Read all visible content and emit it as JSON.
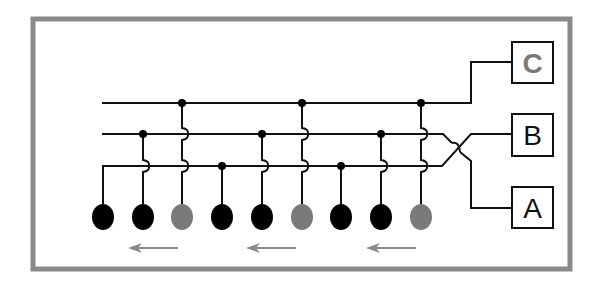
{
  "diagram": {
    "frame": {
      "x": 33,
      "y": 19,
      "w": 537,
      "h": 250,
      "stroke": "#8a8a8a",
      "stroke_width": 5
    },
    "bus_lines": [
      {
        "id": "C",
        "y": 103,
        "x_start": 102
      },
      {
        "id": "B",
        "y": 134,
        "x_start": 102
      },
      {
        "id": "A",
        "y": 166,
        "x_start": 103
      }
    ],
    "columns": [
      {
        "x": 103,
        "phase": "A",
        "color": "#000000"
      },
      {
        "x": 143,
        "phase": "B",
        "color": "#000000"
      },
      {
        "x": 182,
        "phase": "C",
        "color": "#7a7a7a"
      },
      {
        "x": 222,
        "phase": "A",
        "color": "#000000"
      },
      {
        "x": 262,
        "phase": "B",
        "color": "#000000"
      },
      {
        "x": 302,
        "phase": "C",
        "color": "#7a7a7a"
      },
      {
        "x": 341,
        "phase": "A",
        "color": "#000000"
      },
      {
        "x": 381,
        "phase": "B",
        "color": "#000000"
      },
      {
        "x": 421,
        "phase": "C",
        "color": "#7a7a7a"
      }
    ],
    "dot_y": 217,
    "arrows": [
      {
        "x1": 178,
        "x2": 128,
        "y": 248
      },
      {
        "x1": 296,
        "x2": 246,
        "y": 248
      },
      {
        "x1": 416,
        "x2": 366,
        "y": 248
      }
    ],
    "arrow_color": "#8a8a8a",
    "labels": [
      {
        "text": "C",
        "x": 512,
        "y": 42,
        "w": 41,
        "h": 41,
        "color": "#7a7a7a"
      },
      {
        "text": "B",
        "x": 512,
        "y": 114,
        "w": 41,
        "h": 42,
        "color": "#111111"
      },
      {
        "text": "A",
        "x": 512,
        "y": 187,
        "w": 41,
        "h": 41,
        "color": "#111111"
      }
    ]
  }
}
